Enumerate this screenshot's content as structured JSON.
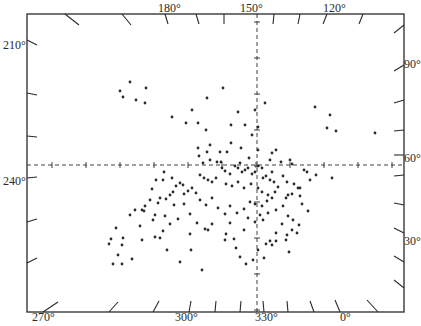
{
  "chart_data": {
    "type": "scatter",
    "title": "",
    "frame": {
      "left": 27,
      "top": 14,
      "right": 404,
      "bottom": 312
    },
    "crosshair": {
      "x": 257,
      "y": 165
    },
    "top_axis": {
      "ticks": [
        "180°",
        "150°",
        "120°"
      ]
    },
    "bottom_axis": {
      "ticks": [
        "270°",
        "300°",
        "330°",
        "0°"
      ]
    },
    "left_axis": {
      "ticks": [
        "210°",
        "240°"
      ]
    },
    "right_axis": {
      "ticks": [
        "90°",
        "60°",
        "30°"
      ]
    },
    "points_px": [
      [
        130,
        82
      ],
      [
        146,
        88
      ],
      [
        120,
        91
      ],
      [
        123,
        97
      ],
      [
        136,
        100
      ],
      [
        145,
        103
      ],
      [
        223,
        88
      ],
      [
        172,
        117
      ],
      [
        186,
        123
      ],
      [
        192,
        110
      ],
      [
        198,
        123
      ],
      [
        207,
        98
      ],
      [
        210,
        145
      ],
      [
        206,
        130
      ],
      [
        238,
        112
      ],
      [
        255,
        110
      ],
      [
        231,
        125
      ],
      [
        245,
        125
      ],
      [
        258,
        127
      ],
      [
        265,
        103
      ],
      [
        198,
        148
      ],
      [
        207,
        152
      ],
      [
        238,
        168
      ],
      [
        241,
        148
      ],
      [
        258,
        150
      ],
      [
        252,
        135
      ],
      [
        272,
        153
      ],
      [
        315,
        107
      ],
      [
        330,
        115
      ],
      [
        327,
        128
      ],
      [
        336,
        131
      ],
      [
        375,
        133
      ],
      [
        231,
        143
      ],
      [
        220,
        152
      ],
      [
        227,
        152
      ],
      [
        249,
        158
      ],
      [
        221,
        162
      ],
      [
        240,
        163
      ],
      [
        258,
        166
      ],
      [
        270,
        160
      ],
      [
        281,
        162
      ],
      [
        290,
        160
      ],
      [
        292,
        164
      ],
      [
        272,
        172
      ],
      [
        304,
        170
      ],
      [
        307,
        172
      ],
      [
        316,
        175
      ],
      [
        332,
        178
      ],
      [
        164,
        172
      ],
      [
        163,
        180
      ],
      [
        156,
        180
      ],
      [
        172,
        178
      ],
      [
        183,
        185
      ],
      [
        199,
        156
      ],
      [
        203,
        163
      ],
      [
        210,
        160
      ],
      [
        217,
        162
      ],
      [
        222,
        168
      ],
      [
        225,
        171
      ],
      [
        230,
        174
      ],
      [
        235,
        166
      ],
      [
        242,
        172
      ],
      [
        248,
        168
      ],
      [
        252,
        174
      ],
      [
        255,
        172
      ],
      [
        262,
        168
      ],
      [
        263,
        178
      ],
      [
        266,
        176
      ],
      [
        270,
        180
      ],
      [
        274,
        182
      ],
      [
        278,
        187
      ],
      [
        283,
        176
      ],
      [
        287,
        182
      ],
      [
        294,
        184
      ],
      [
        300,
        188
      ],
      [
        204,
        178
      ],
      [
        200,
        175
      ],
      [
        208,
        180
      ],
      [
        212,
        182
      ],
      [
        216,
        178
      ],
      [
        226,
        184
      ],
      [
        232,
        186
      ],
      [
        238,
        182
      ],
      [
        244,
        188
      ],
      [
        251,
        184
      ],
      [
        258,
        188
      ],
      [
        262,
        192
      ],
      [
        268,
        195
      ],
      [
        275,
        192
      ],
      [
        286,
        198
      ],
      [
        292,
        194
      ],
      [
        298,
        188
      ],
      [
        302,
        204
      ],
      [
        308,
        211
      ],
      [
        180,
        183
      ],
      [
        176,
        186
      ],
      [
        188,
        191
      ],
      [
        184,
        194
      ],
      [
        192,
        188
      ],
      [
        196,
        193
      ],
      [
        173,
        192
      ],
      [
        170,
        195
      ],
      [
        166,
        199
      ],
      [
        160,
        198
      ],
      [
        158,
        203
      ],
      [
        152,
        189
      ],
      [
        150,
        200
      ],
      [
        145,
        206
      ],
      [
        142,
        210
      ],
      [
        155,
        215
      ],
      [
        165,
        216
      ],
      [
        174,
        205
      ],
      [
        184,
        204
      ],
      [
        200,
        200
      ],
      [
        206,
        205
      ],
      [
        212,
        198
      ],
      [
        218,
        208
      ],
      [
        225,
        214
      ],
      [
        230,
        206
      ],
      [
        237,
        213
      ],
      [
        244,
        209
      ],
      [
        250,
        202
      ],
      [
        255,
        204
      ],
      [
        262,
        206
      ],
      [
        267,
        201
      ],
      [
        272,
        198
      ],
      [
        260,
        215
      ],
      [
        263,
        220
      ],
      [
        268,
        213
      ],
      [
        276,
        210
      ],
      [
        283,
        206
      ],
      [
        288,
        216
      ],
      [
        293,
        220
      ],
      [
        299,
        225
      ],
      [
        292,
        230
      ],
      [
        287,
        235
      ],
      [
        282,
        224
      ],
      [
        276,
        233
      ],
      [
        272,
        245
      ],
      [
        266,
        244
      ],
      [
        270,
        241
      ],
      [
        276,
        241
      ],
      [
        286,
        240
      ],
      [
        297,
        233
      ],
      [
        289,
        252
      ],
      [
        248,
        218
      ],
      [
        255,
        222
      ],
      [
        244,
        230
      ],
      [
        230,
        223
      ],
      [
        226,
        234
      ],
      [
        212,
        224
      ],
      [
        208,
        230
      ],
      [
        197,
        223
      ],
      [
        190,
        214
      ],
      [
        178,
        219
      ],
      [
        170,
        224
      ],
      [
        163,
        231
      ],
      [
        153,
        220
      ],
      [
        140,
        226
      ],
      [
        123,
        238
      ],
      [
        122,
        245
      ],
      [
        111,
        239
      ],
      [
        109,
        244
      ],
      [
        118,
        255
      ],
      [
        122,
        264
      ],
      [
        113,
        264
      ],
      [
        142,
        240
      ],
      [
        155,
        237
      ],
      [
        167,
        250
      ],
      [
        160,
        238
      ],
      [
        180,
        262
      ],
      [
        190,
        234
      ],
      [
        205,
        229
      ],
      [
        225,
        240
      ],
      [
        234,
        239
      ],
      [
        236,
        248
      ],
      [
        240,
        257
      ],
      [
        246,
        264
      ],
      [
        253,
        260
      ],
      [
        258,
        250
      ],
      [
        264,
        258
      ],
      [
        202,
        270
      ],
      [
        132,
        259
      ],
      [
        116,
        228
      ],
      [
        144,
        211
      ],
      [
        135,
        210
      ],
      [
        130,
        215
      ],
      [
        191,
        250
      ],
      [
        245,
        170
      ],
      [
        276,
        150
      ],
      [
        288,
        195
      ],
      [
        310,
        180
      ],
      [
        300,
        196
      ]
    ]
  },
  "labels": {
    "top": [
      {
        "text": "180°",
        "x": 158,
        "y": 2
      },
      {
        "text": "150°",
        "x": 240,
        "y": 2
      },
      {
        "text": "120°",
        "x": 323,
        "y": 2
      }
    ],
    "bottom": [
      {
        "text": "270°",
        "x": 32,
        "y": 311
      },
      {
        "text": "300°",
        "x": 175,
        "y": 311
      },
      {
        "text": "330°",
        "x": 255,
        "y": 311
      },
      {
        "text": "0°",
        "x": 340,
        "y": 311
      }
    ],
    "left": [
      {
        "text": "210°",
        "x": 3,
        "y": 39
      },
      {
        "text": "240°",
        "x": 3,
        "y": 175
      }
    ],
    "right": [
      {
        "text": "90°",
        "x": 404,
        "y": 58
      },
      {
        "text": "60°",
        "x": 404,
        "y": 152
      },
      {
        "text": "30°",
        "x": 404,
        "y": 235
      }
    ]
  },
  "style": {
    "ink": "#2a2a2a",
    "background": "#ffffff"
  }
}
